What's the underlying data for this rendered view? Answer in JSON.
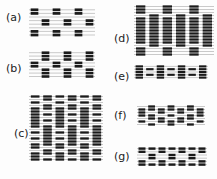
{
  "figure": {
    "panels": [
      {
        "id": "a",
        "label": "(a)",
        "lx": 6,
        "ly": 12,
        "x": 29,
        "y": 7,
        "w": 66,
        "rows": [
          "ABA",
          "-B-",
          "ABA",
          "-B-",
          "A-A",
          "-B-",
          "A-A"
        ],
        "cols": 6,
        "rowH": 3.6,
        "thread": "#bbbbbb",
        "ink": "#1a1a1a",
        "pattern": [
          [
            1,
            0,
            1,
            0,
            1,
            0
          ],
          [
            1,
            0,
            1,
            0,
            1,
            0
          ],
          [
            0,
            0,
            0,
            0,
            0,
            0
          ],
          [
            0,
            1,
            0,
            1,
            0,
            1
          ],
          [
            0,
            1,
            0,
            1,
            0,
            1
          ],
          [
            0,
            0,
            0,
            0,
            0,
            0
          ],
          [
            1,
            0,
            1,
            0,
            1,
            0
          ],
          [
            1,
            0,
            1,
            0,
            1,
            0
          ]
        ]
      },
      {
        "id": "b",
        "label": "(b)",
        "lx": 6,
        "ly": 63,
        "x": 29,
        "y": 50,
        "w": 66,
        "cols": 6,
        "rowH": 3.4,
        "thread": "#bbbbbb",
        "ink": "#1a1a1a",
        "pattern": [
          [
            0,
            1,
            0,
            1,
            0,
            1
          ],
          [
            0,
            1,
            0,
            1,
            0,
            1
          ],
          [
            0,
            1,
            0,
            1,
            0,
            1
          ],
          [
            1,
            0,
            1,
            0,
            1,
            0
          ],
          [
            1,
            0,
            1,
            0,
            1,
            0
          ],
          [
            0,
            1,
            0,
            1,
            0,
            1
          ],
          [
            0,
            1,
            0,
            1,
            0,
            1
          ],
          [
            0,
            1,
            0,
            1,
            0,
            1
          ]
        ]
      },
      {
        "id": "c",
        "label": "(c)",
        "lx": 14,
        "ly": 128,
        "x": 29,
        "y": 94,
        "w": 74,
        "cols": 6,
        "rowH": 3.0,
        "thread": "#bbbbbb",
        "ink": "#1a1a1a",
        "pattern": [
          [
            1,
            1,
            1,
            1,
            1,
            1
          ],
          [
            0,
            1,
            0,
            1,
            0,
            1
          ],
          [
            1,
            0,
            1,
            0,
            1,
            0
          ],
          [
            0,
            1,
            0,
            1,
            0,
            1
          ],
          [
            1,
            1,
            1,
            1,
            1,
            1
          ],
          [
            1,
            0,
            1,
            0,
            1,
            0
          ],
          [
            1,
            1,
            1,
            1,
            1,
            1
          ],
          [
            1,
            0,
            1,
            0,
            1,
            0
          ],
          [
            1,
            1,
            1,
            1,
            1,
            1
          ],
          [
            1,
            0,
            1,
            0,
            1,
            0
          ],
          [
            1,
            1,
            1,
            1,
            1,
            1
          ],
          [
            0,
            1,
            0,
            1,
            0,
            1
          ],
          [
            1,
            1,
            1,
            1,
            1,
            1
          ],
          [
            0,
            1,
            0,
            1,
            0,
            1
          ],
          [
            1,
            1,
            1,
            1,
            1,
            1
          ],
          [
            0,
            1,
            0,
            1,
            0,
            1
          ],
          [
            1,
            1,
            1,
            1,
            1,
            1
          ],
          [
            1,
            0,
            1,
            0,
            1,
            0
          ],
          [
            0,
            1,
            0,
            1,
            0,
            1
          ],
          [
            1,
            1,
            1,
            1,
            1,
            1
          ],
          [
            1,
            0,
            1,
            0,
            1,
            0
          ],
          [
            1,
            1,
            1,
            1,
            1,
            1
          ]
        ]
      },
      {
        "id": "d",
        "label": "(d)",
        "lx": 114,
        "ly": 33,
        "x": 134,
        "y": 4,
        "w": 80,
        "cols": 6,
        "rowH": 3.0,
        "thread": "#bbbbbb",
        "ink": "#1a1a1a",
        "pattern": [
          [
            1,
            0,
            1,
            0,
            1,
            0
          ],
          [
            1,
            0,
            1,
            0,
            1,
            0
          ],
          [
            1,
            0,
            1,
            0,
            1,
            0
          ],
          [
            0,
            1,
            0,
            1,
            0,
            1
          ],
          [
            1,
            1,
            1,
            1,
            1,
            1
          ],
          [
            1,
            1,
            1,
            1,
            1,
            1
          ],
          [
            1,
            1,
            1,
            1,
            1,
            1
          ],
          [
            1,
            1,
            1,
            1,
            1,
            1
          ],
          [
            1,
            1,
            1,
            1,
            1,
            1
          ],
          [
            1,
            1,
            1,
            1,
            1,
            1
          ],
          [
            1,
            1,
            1,
            1,
            1,
            1
          ],
          [
            1,
            1,
            1,
            1,
            1,
            1
          ],
          [
            1,
            1,
            1,
            1,
            1,
            1
          ],
          [
            0,
            1,
            0,
            1,
            0,
            1
          ],
          [
            1,
            0,
            1,
            0,
            1,
            0
          ],
          [
            1,
            0,
            1,
            0,
            1,
            0
          ],
          [
            1,
            0,
            1,
            0,
            1,
            0
          ]
        ]
      },
      {
        "id": "e",
        "label": "(e)",
        "lx": 114,
        "ly": 71,
        "x": 134,
        "y": 64,
        "w": 74,
        "cols": 7,
        "rowH": 2.8,
        "thread": "#bbbbbb",
        "ink": "#1a1a1a",
        "pattern": [
          [
            1,
            0,
            1,
            0,
            1,
            0,
            1
          ],
          [
            1,
            1,
            1,
            1,
            1,
            1,
            1
          ],
          [
            1,
            0,
            1,
            0,
            1,
            0,
            1
          ],
          [
            1,
            1,
            1,
            1,
            1,
            1,
            1
          ],
          [
            1,
            0,
            1,
            0,
            1,
            0,
            1
          ]
        ]
      },
      {
        "id": "f",
        "label": "(f)",
        "lx": 114,
        "ly": 110,
        "x": 137,
        "y": 104,
        "w": 68,
        "cols": 7,
        "rowH": 3.0,
        "thread": "#bbbbbb",
        "ink": "#1a1a1a",
        "pattern": [
          [
            0,
            1,
            0,
            1,
            0,
            1,
            0
          ],
          [
            1,
            1,
            1,
            1,
            1,
            1,
            1
          ],
          [
            1,
            0,
            1,
            0,
            1,
            0,
            1
          ],
          [
            1,
            1,
            0,
            1,
            0,
            1,
            1
          ],
          [
            0,
            1,
            1,
            0,
            1,
            1,
            0
          ],
          [
            1,
            0,
            1,
            1,
            1,
            0,
            1
          ],
          [
            0,
            1,
            0,
            1,
            0,
            1,
            0
          ]
        ]
      },
      {
        "id": "g",
        "label": "(g)",
        "lx": 114,
        "ly": 151,
        "x": 137,
        "y": 146,
        "w": 70,
        "cols": 7,
        "rowH": 3.2,
        "thread": "#bbbbbb",
        "ink": "#1a1a1a",
        "pattern": [
          [
            1,
            1,
            1,
            1,
            1,
            1,
            1
          ],
          [
            1,
            0,
            1,
            0,
            1,
            0,
            1
          ],
          [
            0,
            1,
            0,
            1,
            0,
            1,
            0
          ],
          [
            0,
            1,
            0,
            1,
            0,
            1,
            0
          ],
          [
            1,
            0,
            1,
            0,
            1,
            0,
            1
          ],
          [
            1,
            1,
            1,
            1,
            1,
            1,
            1
          ]
        ]
      }
    ]
  }
}
